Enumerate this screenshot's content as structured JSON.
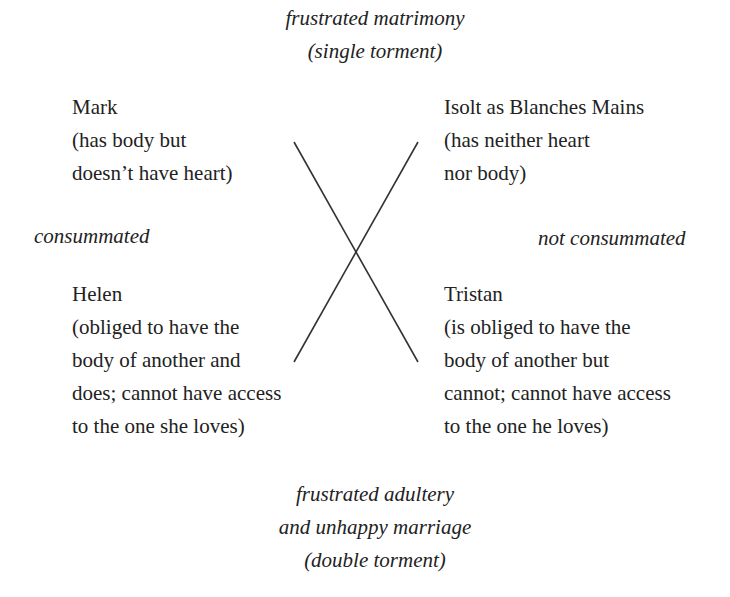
{
  "top": {
    "line1": "frustrated matrimony",
    "line2": "(single torment)"
  },
  "mark": {
    "name": "Mark",
    "desc1": "(has body but",
    "desc2": "doesn’t have heart)"
  },
  "isolt": {
    "name": "Isolt as Blanches Mains",
    "desc1": "(has neither heart",
    "desc2": "nor body)"
  },
  "left_label": "consummated",
  "right_label": "not consummated",
  "helen": {
    "name": "Helen",
    "desc1": "(obliged to have the",
    "desc2": "body of another and",
    "desc3": "does; cannot have access",
    "desc4": "to the one she loves)"
  },
  "tristan": {
    "name": "Tristan",
    "desc1": "(is obliged to have the",
    "desc2": "body of another but",
    "desc3": "cannot; cannot have access",
    "desc4": "to the one he loves)"
  },
  "bottom": {
    "line1": "frustrated adultery",
    "line2": "and unhappy marriage",
    "line3": "(double torment)"
  },
  "colors": {
    "text": "#222222",
    "lines": "#333333",
    "background": "#ffffff"
  }
}
